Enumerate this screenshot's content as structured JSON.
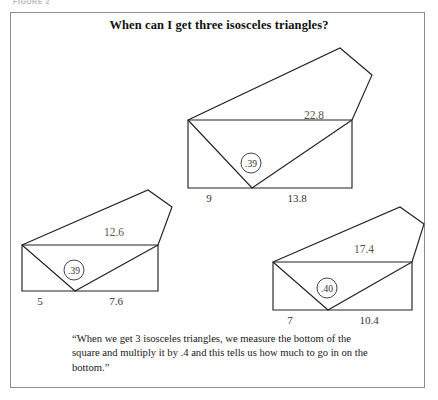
{
  "figure": {
    "top_label": "FIGURE 2",
    "title": "When can I get three isosceles triangles?",
    "quote": "“When we get 3 isosceles triangles, we measure the bottom of the square and multiply it by .4 and this tells us how much to go in on the bottom.”"
  },
  "diagrams": [
    {
      "id": "top-figure",
      "name": "isosceles-figure-large",
      "left_base": "9",
      "right_base": "13.8",
      "hypotenuse": "22.8",
      "ratio": ".39"
    },
    {
      "id": "left-figure",
      "name": "isosceles-figure-small",
      "left_base": "5",
      "right_base": "7.6",
      "hypotenuse": "12.6",
      "ratio": ".39"
    },
    {
      "id": "right-figure",
      "name": "isosceles-figure-medium",
      "left_base": "7",
      "right_base": "10.4",
      "hypotenuse": "17.4",
      "ratio": ".40"
    }
  ]
}
